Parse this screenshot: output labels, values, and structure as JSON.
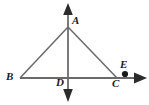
{
  "figure": {
    "background_color": "#ffffff",
    "stroke_color": "#555555",
    "label_color": "#1a1a1a",
    "labels": {
      "A": "A",
      "B": "B",
      "C": "C",
      "D": "D",
      "E": "E"
    },
    "points": {
      "A": {
        "x": 68,
        "y": 27
      },
      "B": {
        "x": 20,
        "y": 78
      },
      "C": {
        "x": 117,
        "y": 78
      },
      "D": {
        "x": 68,
        "y": 78
      },
      "E": {
        "x": 125,
        "y": 74
      }
    },
    "segments": [
      {
        "name": "segment-AB",
        "from": "A",
        "to": "B"
      },
      {
        "name": "segment-AC",
        "from": "A",
        "to": "C"
      },
      {
        "name": "segment-AD",
        "from": "A",
        "to": "D"
      }
    ],
    "lines": [
      {
        "name": "vertical-line",
        "orientation": "vertical",
        "x": 68,
        "from_y": 4,
        "to_y": 101,
        "arrow_start": true,
        "arrow_end": true
      },
      {
        "name": "horizontal-ray",
        "orientation": "horizontal",
        "y": 78,
        "from_x": 20,
        "to_x": 146,
        "arrow_start": false,
        "arrow_end": true
      }
    ],
    "markers": [
      {
        "name": "point-E-dot",
        "x": 125,
        "y": 74,
        "radius": 3,
        "filled": true
      }
    ]
  }
}
